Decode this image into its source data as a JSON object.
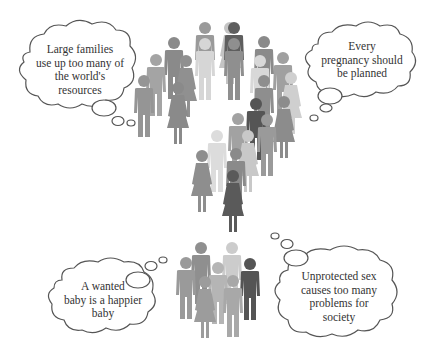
{
  "figure": {
    "background": "#ffffff",
    "bubble_stroke": "#555555",
    "figure_colors": {
      "dark": "#5a5a5a",
      "mid": "#8c8c8c",
      "mid_light": "#a0a0a0",
      "light": "#c4c4c4",
      "lightest": "#dadada"
    }
  },
  "bubbles": [
    {
      "id": "top-left",
      "text": "Large families\nuse up too many of\nthe world's\nresources"
    },
    {
      "id": "top-right",
      "text": "Every\npregnancy should\nbe planned"
    },
    {
      "id": "bottom-left",
      "text": "A wanted\nbaby is a happier\nbaby"
    },
    {
      "id": "bottom-right",
      "text": "Unprotected sex\ncauses too many\nproblems for\nsociety"
    }
  ]
}
